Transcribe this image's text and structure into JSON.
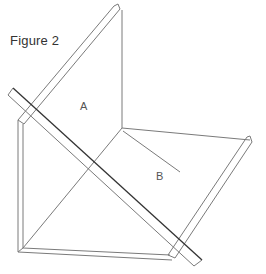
{
  "figure": {
    "title": "Figure 2",
    "labels": {
      "panel_a": "A",
      "panel_b": "B"
    },
    "colors": {
      "background": "#ffffff",
      "line": "#777777",
      "dark_line": "#333333",
      "text": "#333333"
    }
  }
}
